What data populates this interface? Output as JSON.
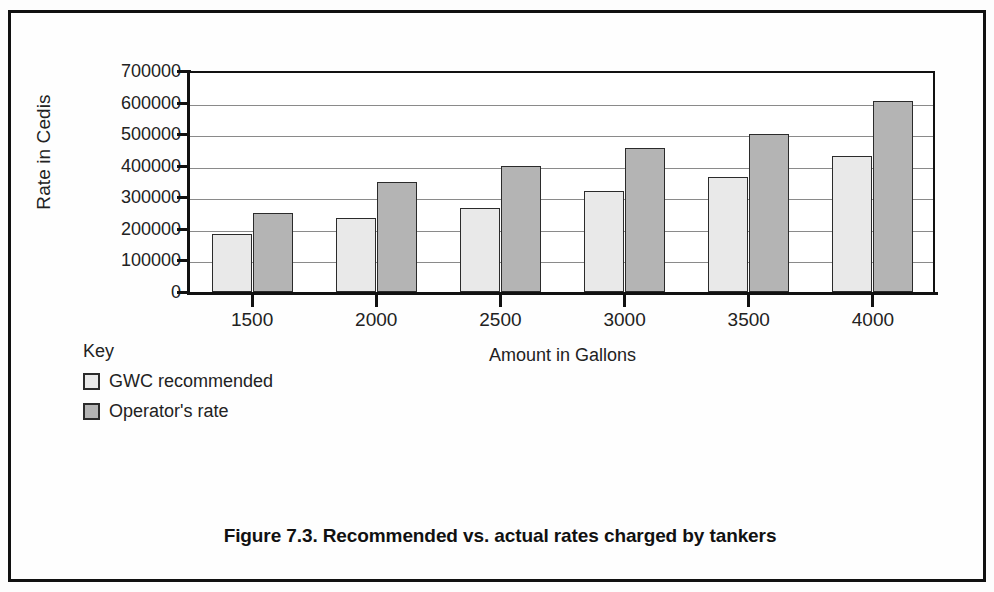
{
  "figure": {
    "caption": "Figure 7.3. Recommended vs. actual rates charged by tankers",
    "legend_title": "Key"
  },
  "chart_data": {
    "type": "bar",
    "title": "",
    "xlabel": "Amount in Gallons",
    "ylabel": "Rate in Cedis",
    "categories": [
      "1500",
      "2000",
      "2500",
      "3000",
      "3500",
      "4000"
    ],
    "series": [
      {
        "name": "GWC recommended",
        "color": "#e9e9e9",
        "values": [
          185000,
          235000,
          265000,
          320000,
          365000,
          430000
        ]
      },
      {
        "name": "Operator's rate",
        "color": "#b4b4b4",
        "values": [
          250000,
          350000,
          400000,
          455000,
          500000,
          605000
        ]
      }
    ],
    "ylim": [
      0,
      700000
    ],
    "ytick_values": [
      0,
      100000,
      200000,
      300000,
      400000,
      500000,
      600000,
      700000
    ],
    "ytick_labels": [
      "0",
      "100000",
      "200000",
      "300000",
      "400000",
      "500000",
      "600000",
      "700000"
    ],
    "grid": true,
    "grid_axis": "y",
    "legend_position": "below-left",
    "bar_border_color": "#2b2b2b"
  }
}
